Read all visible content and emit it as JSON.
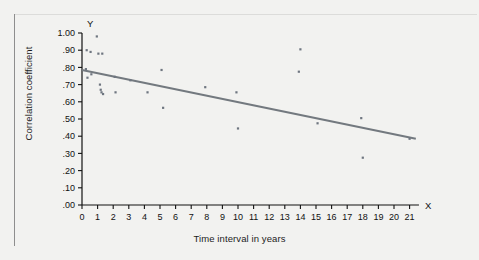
{
  "figure": {
    "background_color": "#f2f2f0",
    "axis_color": "#111111",
    "point_color": "#6f7680",
    "trendline_color": "#73797f"
  },
  "chart_data": {
    "type": "scatter",
    "title": "",
    "xlabel": "Time interval in years",
    "ylabel": "Correlation coefficient",
    "x_axis_letter": "X",
    "y_axis_letter": "Y",
    "xlim": [
      0,
      21.6
    ],
    "ylim": [
      0.0,
      1.0
    ],
    "grid": false,
    "legend": "none",
    "xticks": [
      0,
      1,
      2,
      3,
      4,
      5,
      6,
      7,
      8,
      9,
      10,
      11,
      12,
      13,
      14,
      15,
      16,
      17,
      18,
      19,
      20,
      21
    ],
    "xticklabels": [
      "0",
      "1",
      "2",
      "3",
      "4",
      "5",
      "6",
      "7",
      "8",
      "9",
      "10",
      "11",
      "12",
      "13",
      "14",
      "15",
      "16",
      "17",
      "18",
      "19",
      "20",
      "21"
    ],
    "yticks": [
      0.0,
      0.1,
      0.2,
      0.3,
      0.4,
      0.5,
      0.6,
      0.7,
      0.8,
      0.9,
      1.0
    ],
    "yticklabels": [
      ".00",
      ".10",
      ".20",
      ".30",
      ".40",
      ".50",
      ".60",
      ".70",
      ".80",
      ".90",
      "1.00"
    ],
    "points": [
      {
        "x": 0.25,
        "y": 0.79
      },
      {
        "x": 0.3,
        "y": 0.9
      },
      {
        "x": 0.35,
        "y": 0.74
      },
      {
        "x": 0.55,
        "y": 0.89
      },
      {
        "x": 0.6,
        "y": 0.76
      },
      {
        "x": 0.95,
        "y": 0.98
      },
      {
        "x": 1.05,
        "y": 0.88
      },
      {
        "x": 1.15,
        "y": 0.7
      },
      {
        "x": 1.2,
        "y": 0.67
      },
      {
        "x": 1.25,
        "y": 0.655
      },
      {
        "x": 1.3,
        "y": 0.88
      },
      {
        "x": 1.35,
        "y": 0.645
      },
      {
        "x": 2.1,
        "y": 0.745
      },
      {
        "x": 2.15,
        "y": 0.655
      },
      {
        "x": 3.1,
        "y": 0.725
      },
      {
        "x": 4.2,
        "y": 0.655
      },
      {
        "x": 5.1,
        "y": 0.785
      },
      {
        "x": 5.2,
        "y": 0.565
      },
      {
        "x": 7.9,
        "y": 0.685
      },
      {
        "x": 9.9,
        "y": 0.655
      },
      {
        "x": 10.0,
        "y": 0.445
      },
      {
        "x": 13.9,
        "y": 0.775
      },
      {
        "x": 14.0,
        "y": 0.905
      },
      {
        "x": 15.1,
        "y": 0.475
      },
      {
        "x": 17.9,
        "y": 0.505
      },
      {
        "x": 18.0,
        "y": 0.275
      },
      {
        "x": 21.0,
        "y": 0.385
      }
    ],
    "trendline": {
      "x_start": 0.0,
      "y_start": 0.785,
      "x_end": 21.4,
      "y_end": 0.385,
      "slope": -0.0187,
      "intercept": 0.785
    }
  }
}
